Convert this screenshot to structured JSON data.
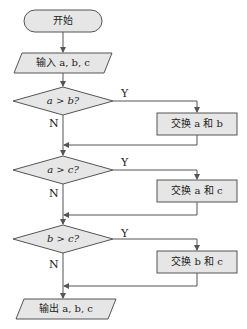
{
  "flowchart": {
    "start": {
      "label": "开始"
    },
    "input": {
      "label": "输入 a, b, c"
    },
    "decisions": [
      {
        "label": "a > b?",
        "yes": "Y",
        "no": "N"
      },
      {
        "label": "a > c?",
        "yes": "Y",
        "no": "N"
      },
      {
        "label": "b > c?",
        "yes": "Y",
        "no": "N"
      }
    ],
    "processes": [
      {
        "label": "交换 a 和 b"
      },
      {
        "label": "交换 a 和 c"
      },
      {
        "label": "交换 b 和 c"
      }
    ],
    "output": {
      "label": "输出 a, b, c"
    }
  },
  "colors": {
    "fill": "#e6e6e6",
    "stroke": "#555555",
    "text": "#222222"
  }
}
